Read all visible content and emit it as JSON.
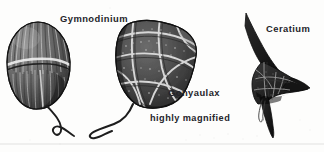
{
  "figure": {
    "background_color": "#fdfdfc",
    "ink_color": "#24242a",
    "width": 324,
    "height": 152
  },
  "labels": {
    "gymnodinium": "Gymnodinium",
    "gonyaulax": "Gonyaulax",
    "ceratium": "Ceratium",
    "magnification_note": "highly magnified"
  },
  "organisms": [
    {
      "name": "Gymnodinium",
      "label": "Gymnodinium",
      "description": "unarmoured dinoflagellate, ovoid cell with vertical ribs, transverse cingulum groove and trailing flagellum",
      "position": "left",
      "has_flagellum": true
    },
    {
      "name": "Gonyaulax",
      "label": "Gonyaulax",
      "description": "armoured dinoflagellate, angular thecal plates with suture ridges and pores, trailing flagellum",
      "position": "center",
      "has_flagellum": true
    },
    {
      "name": "Ceratium",
      "label": "Ceratium",
      "description": "armoured dinoflagellate with one long apical horn and two antapical horns",
      "position": "right",
      "has_flagellum": true
    }
  ],
  "annotations": {
    "footer_rule": "faint horizontal scan rule near page foot"
  }
}
